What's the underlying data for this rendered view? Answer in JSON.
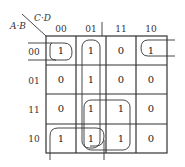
{
  "kmap": {
    "row_var_label": "A·B",
    "col_var_label": "C·D",
    "col_headers": [
      "00",
      "01",
      "11",
      "10"
    ],
    "row_headers": [
      "00",
      "01",
      "11",
      "10"
    ],
    "cells": [
      [
        "1",
        "1",
        "0",
        "1"
      ],
      [
        "0",
        "1",
        "0",
        "0"
      ],
      [
        "0",
        "1",
        "1",
        "0"
      ],
      [
        "1",
        "1",
        "1",
        "0"
      ]
    ],
    "groups": [
      {
        "name": "corners-row00-wrap",
        "cells": [
          [
            0,
            0
          ],
          [
            0,
            3
          ]
        ]
      },
      {
        "name": "column-01",
        "cells": [
          [
            0,
            1
          ],
          [
            1,
            1
          ],
          [
            2,
            1
          ],
          [
            3,
            1
          ]
        ]
      },
      {
        "name": "quad-rows11-10-cols01-11",
        "cells": [
          [
            2,
            1
          ],
          [
            2,
            2
          ],
          [
            3,
            1
          ],
          [
            3,
            2
          ]
        ]
      },
      {
        "name": "row10-wrap-pair",
        "cells": [
          [
            3,
            0
          ],
          [
            3,
            1
          ]
        ]
      }
    ]
  }
}
